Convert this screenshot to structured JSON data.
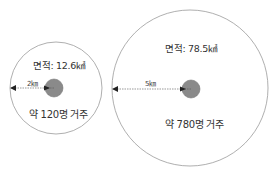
{
  "diagram": {
    "small": {
      "area_label": "면적: 12.6㎢",
      "population_label": "약 120명 거주",
      "radius_label": "2㎞",
      "radius_km": 2,
      "area_km2": 12.6,
      "population": 120
    },
    "large": {
      "area_label": "면적: 78.5㎢",
      "population_label": "약 780명 거주",
      "radius_label": "5㎞",
      "radius_km": 5,
      "area_km2": 78.5,
      "population": 780
    },
    "colors": {
      "outline": "#9a9a9a",
      "center_dot": "#8a8a8a",
      "arrow": "#222222"
    }
  }
}
